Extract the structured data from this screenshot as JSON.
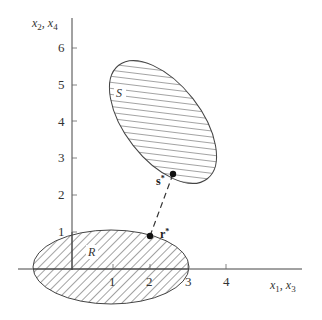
{
  "diagram": {
    "y_axis_label": {
      "a": "x",
      "a_sub": "2",
      "sep": ", ",
      "b": "x",
      "b_sub": "4"
    },
    "x_axis_label": {
      "a": "x",
      "a_sub": "1",
      "sep": ", ",
      "b": "x",
      "b_sub": "3"
    },
    "x_ticks": [
      "1",
      "2",
      "3",
      "4"
    ],
    "y_ticks": [
      "1",
      "2",
      "3",
      "4",
      "5",
      "6"
    ],
    "regions": {
      "S": {
        "label": "S"
      },
      "R": {
        "label": "R"
      }
    },
    "points": {
      "s_star": {
        "label": "s",
        "sup": "*"
      },
      "r_star": {
        "label": "r",
        "sup": "*"
      }
    },
    "colors": {
      "stroke": "#444444",
      "hatch": "#555555",
      "fill": "#ffffff"
    }
  }
}
